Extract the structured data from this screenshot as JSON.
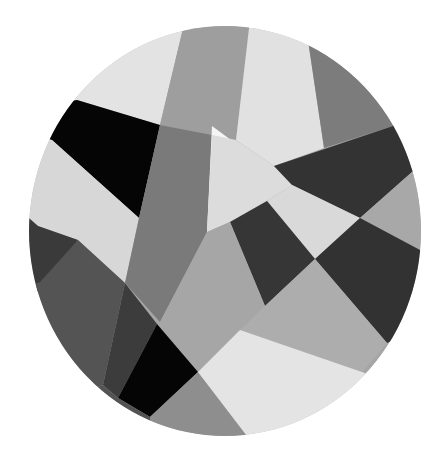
{
  "artwork": {
    "title": "Abstract geometric circle",
    "shape": {
      "cx": 225,
      "cy": 231,
      "rx": 196,
      "ry": 205
    },
    "colors": {
      "background": "#ffffff",
      "white": "#f4f4f4",
      "light": "#e3e3e3",
      "lightgray": "#c6c6c6",
      "midgray": "#a9a9a9",
      "gray": "#8f8f8f",
      "darkgray": "#6c6c6c",
      "dark": "#3e3e3e",
      "verydark": "#2f2f2f",
      "black": "#050505"
    },
    "polygons": [
      {
        "name": "top-left-light",
        "fill": "#e3e3e3",
        "points": "20,20 185,20 160,125 77,100 20,110"
      },
      {
        "name": "top-gray-band",
        "fill": "#9e9e9e",
        "points": "185,20 250,20 236,140 212,135 160,125"
      },
      {
        "name": "top-light-band",
        "fill": "#e1e1e1",
        "points": "250,20 305,20 324,148 274,166 236,140"
      },
      {
        "name": "top-right-gray",
        "fill": "#7c7c7c",
        "points": "305,20 440,20 440,110 390,127 324,148"
      },
      {
        "name": "black-top-left",
        "fill": "#050505",
        "points": "77,100 160,125 139,218 52,140 20,130 20,110"
      },
      {
        "name": "left-light-band",
        "fill": "#d7d7d7",
        "points": "20,135 52,140 139,218 125,283 78,240 38,226 20,220"
      },
      {
        "name": "left-dark-wedge",
        "fill": "#3a3a3a",
        "points": "20,210 38,226 78,240 40,290 20,300"
      },
      {
        "name": "left-dark-medium",
        "fill": "#545454",
        "points": "20,290 40,282 78,240 125,283 103,385 60,400 20,400"
      },
      {
        "name": "left-sliver",
        "fill": "#3c3c3c",
        "points": "125,283 157,324 118,398 103,385"
      },
      {
        "name": "center-gray-strip",
        "fill": "#7a7a7a",
        "points": "160,125 212,135 207,232 160,322 125,283 139,218"
      },
      {
        "name": "white-triangle",
        "fill": "#f4f4f4",
        "points": "212,126 292,185 207,232"
      },
      {
        "name": "center-light",
        "fill": "#dcdcdc",
        "points": "236,140 274,166 292,185 267,201 230,222 207,232 212,135"
      },
      {
        "name": "top-dark-band",
        "fill": "#333333",
        "points": "274,166 390,127 440,110 440,160 412,172 360,218 292,185"
      },
      {
        "name": "light-mid-right",
        "fill": "#d9d9d9",
        "points": "292,185 360,218 315,259 267,201"
      },
      {
        "name": "right-gray-wedge",
        "fill": "#a8a8a8",
        "points": "412,172 440,160 440,255 420,250 360,218"
      },
      {
        "name": "center-dark-quad",
        "fill": "#363636",
        "points": "230,222 267,201 315,259 265,306"
      },
      {
        "name": "right-dark-quad",
        "fill": "#323232",
        "points": "360,218 420,250 440,255 440,320 387,343 315,259"
      },
      {
        "name": "center-medium-gray",
        "fill": "#a6a6a6",
        "points": "207,232 230,222 265,306 240,330 198,372 157,324 160,322"
      },
      {
        "name": "lower-right-gray",
        "fill": "#adadad",
        "points": "265,306 315,259 387,343 362,372 240,330"
      },
      {
        "name": "black-bottom",
        "fill": "#050505",
        "points": "157,324 198,372 150,417 118,398"
      },
      {
        "name": "bottom-gray-triangle",
        "fill": "#8e8e8e",
        "points": "198,372 250,440 150,440 150,417"
      },
      {
        "name": "bottom-light",
        "fill": "#e4e4e4",
        "points": "198,372 240,330 362,372 440,400 440,440 250,440"
      },
      {
        "name": "bottom-left-fill",
        "fill": "#545454",
        "points": "20,400 60,400 103,385 118,398 150,417 150,440 20,440"
      }
    ]
  }
}
